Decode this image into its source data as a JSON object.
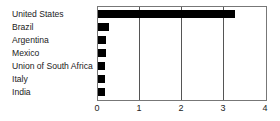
{
  "chart_data": {
    "type": "bar",
    "orientation": "horizontal",
    "title": "",
    "xlabel": "",
    "ylabel": "",
    "categories": [
      "United States",
      "Brazil",
      "Argentina",
      "Mexico",
      "Union of South Africa",
      "Italy",
      "India"
    ],
    "values": [
      3.27,
      0.27,
      0.19,
      0.19,
      0.17,
      0.16,
      0.16
    ],
    "xlim": [
      0,
      4
    ],
    "xticks": [
      "0",
      "1",
      "2",
      "3",
      "4"
    ],
    "grid": "vertical",
    "legend": null,
    "bar_color": "#000000"
  }
}
